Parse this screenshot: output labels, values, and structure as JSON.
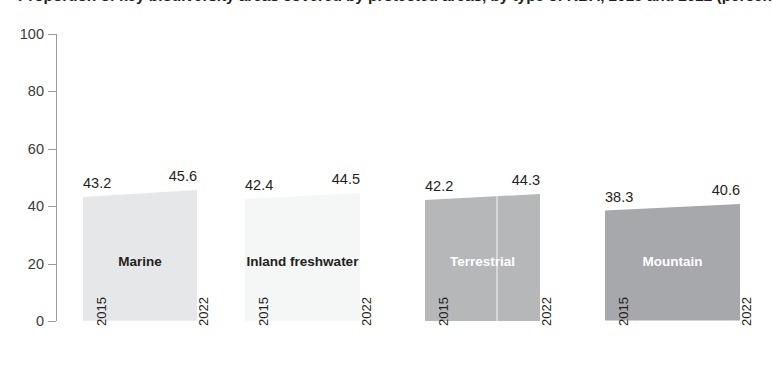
{
  "chart_data": {
    "type": "area",
    "title": "Proportion of key biodiversity areas covered by protected areas, by type of KBA, 2015 and 2022 (percentage)",
    "title_visible_fragment": "…ype of … areas, 2015–2022 (percentage)",
    "xlabel": "",
    "ylabel": "",
    "ylim": [
      0,
      100
    ],
    "ytick_labels": [
      "100",
      "80",
      "60",
      "40",
      "20",
      "0"
    ],
    "ytick_values": [
      100,
      80,
      60,
      40,
      20,
      0
    ],
    "x": [
      "2015",
      "2022"
    ],
    "grid": false,
    "legend": "none",
    "series": [
      {
        "name": "Marine",
        "values": [
          43.2,
          45.6
        ],
        "start_label": "43.2",
        "end_label": "45.6",
        "color": "#e6e7e8",
        "label_color": "#231f20"
      },
      {
        "name": "Inland freshwater",
        "values": [
          42.4,
          44.5
        ],
        "start_label": "42.4",
        "end_label": "44.5",
        "color": "#f5f6f6",
        "label_color": "#231f20"
      },
      {
        "name": "Terrestrial",
        "values": [
          42.2,
          44.3
        ],
        "start_label": "42.2",
        "end_label": "44.3",
        "color": "#b5b7b9",
        "label_color": "#ffffff"
      },
      {
        "name": "Mountain",
        "values": [
          38.3,
          40.6
        ],
        "start_label": "38.3",
        "end_label": "40.6",
        "color": "#a6a8ab",
        "label_color": "#ffffff"
      }
    ]
  },
  "axis": {
    "y_ticks": [
      {
        "label": "100"
      },
      {
        "label": "80"
      },
      {
        "label": "60"
      },
      {
        "label": "40"
      },
      {
        "label": "20"
      },
      {
        "label": "0"
      }
    ]
  },
  "bands": [
    {
      "name": "Marine",
      "start_year": "2015",
      "end_year": "2022",
      "start_label": "43.2",
      "end_label": "44.5",
      "end_label_text": "45.6"
    },
    {
      "name": "Inland freshwater",
      "start_year": "2015",
      "end_year": "2022",
      "start_label": "42.4",
      "end_label_text": "44.5"
    },
    {
      "name": "Terrestrial",
      "start_year": "2015",
      "end_year": "2022",
      "start_label": "42.2",
      "end_label_text": "44.3"
    },
    {
      "name": "Mountain",
      "start_year": "2015",
      "end_year": "2022",
      "start_label": "38.3",
      "end_label_text": "40.6"
    }
  ]
}
